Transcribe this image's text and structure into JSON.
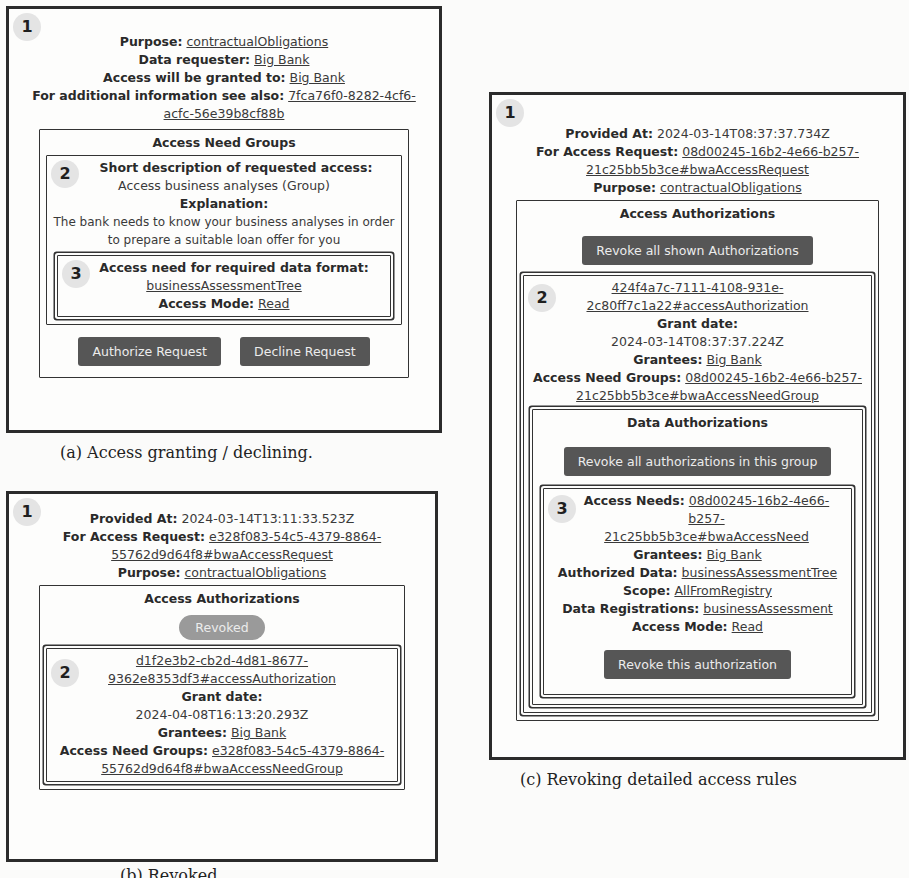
{
  "panel_a": {
    "badge_1": "1",
    "purpose_label": "Purpose:",
    "purpose_value": "contractualObligations",
    "requester_label": "Data requester:",
    "requester_value": "Big Bank",
    "granted_to_label": "Access will be granted to:",
    "granted_to_value": "Big Bank",
    "additional_info_label": "For additional information see also:",
    "additional_info_value_1": "7fca76f0-8282-4cf6-",
    "additional_info_value_2": "acfc-56e39b8cf88b",
    "access_need_groups_title": "Access Need Groups",
    "badge_2": "2",
    "short_desc_label": "Short description of requested access:",
    "short_desc_value": "Access business analyses (Group)",
    "explanation_label": "Explanation:",
    "explanation_value_1": "The bank needs to know your business analyses in order",
    "explanation_value_2": "to prepare a suitable loan offer for you",
    "badge_3": "3",
    "data_format_label": "Access need for required data format:",
    "data_format_value": "businessAssessmentTree",
    "access_mode_label": "Access Mode:",
    "access_mode_value": "Read",
    "authorize_button": "Authorize Request",
    "decline_button": "Decline Request",
    "caption": "(a) Access granting / declining."
  },
  "panel_b": {
    "badge_1": "1",
    "provided_at_label": "Provided At:",
    "provided_at_value": "2024-03-14T13:11:33.523Z",
    "access_request_label": "For Access Request:",
    "access_request_value_1": "e328f083-54c5-4379-8864-",
    "access_request_value_2": "55762d9d64f8#bwaAccessRequest",
    "purpose_label": "Purpose:",
    "purpose_value": "contractualObligations",
    "access_authorizations_title": "Access Authorizations",
    "revoked_status": "Revoked",
    "badge_2": "2",
    "authorization_id_1": "d1f2e3b2-cb2d-4d81-8677-",
    "authorization_id_2": "9362e8353df3#accessAuthorization",
    "grant_date_label": "Grant date:",
    "grant_date_value": "2024-04-08T16:13:20.293Z",
    "grantees_label": "Grantees:",
    "grantees_value": "Big Bank",
    "access_need_groups_label": "Access Need Groups:",
    "access_need_groups_value_1": "e328f083-54c5-4379-8864-",
    "access_need_groups_value_2": "55762d9d64f8#bwaAccessNeedGroup",
    "caption": "(b) Revoked..."
  },
  "panel_c": {
    "badge_1": "1",
    "provided_at_label": "Provided At:",
    "provided_at_value": "2024-03-14T08:37:37.734Z",
    "access_request_label": "For Access Request:",
    "access_request_value_1": "08d00245-16b2-4e66-b257-",
    "access_request_value_2": "21c25bb5b3ce#bwaAccessRequest",
    "purpose_label": "Purpose:",
    "purpose_value": "contractualObligations",
    "access_authorizations_title": "Access Authorizations",
    "revoke_all_shown_button": "Revoke all shown Authorizations",
    "badge_2": "2",
    "authorization_id_1": "424f4a7c-7111-4108-931e-",
    "authorization_id_2": "2c80ff7c1a22#accessAuthorization",
    "grant_date_label": "Grant date:",
    "grant_date_value": "2024-03-14T08:37:37.224Z",
    "grantees_label": "Grantees:",
    "grantees_value": "Big Bank",
    "access_need_groups_label": "Access Need Groups:",
    "access_need_groups_value_1": "08d00245-16b2-4e66-b257-",
    "access_need_groups_value_2": "21c25bb5b3ce#bwaAccessNeedGroup",
    "data_authorizations_title": "Data Authorizations",
    "revoke_group_button": "Revoke all authorizations in this group",
    "badge_3": "3",
    "access_needs_label": "Access Needs:",
    "access_needs_value_1": "08d00245-16b2-4e66-b257-",
    "access_needs_value_2": "21c25bb5b3ce#bwaAccessNeed",
    "grantees2_label": "Grantees:",
    "grantees2_value": "Big Bank",
    "authorized_data_label": "Authorized Data:",
    "authorized_data_value": "businessAssessmentTree",
    "scope_label": "Scope:",
    "scope_value": "AllFromRegistry",
    "data_registrations_label": "Data Registrations:",
    "data_registrations_value": "businessAssessment",
    "access_mode_label": "Access Mode:",
    "access_mode_value": "Read",
    "revoke_this_button": "Revoke this authorization",
    "caption": "(c) Revoking detailed access rules"
  }
}
